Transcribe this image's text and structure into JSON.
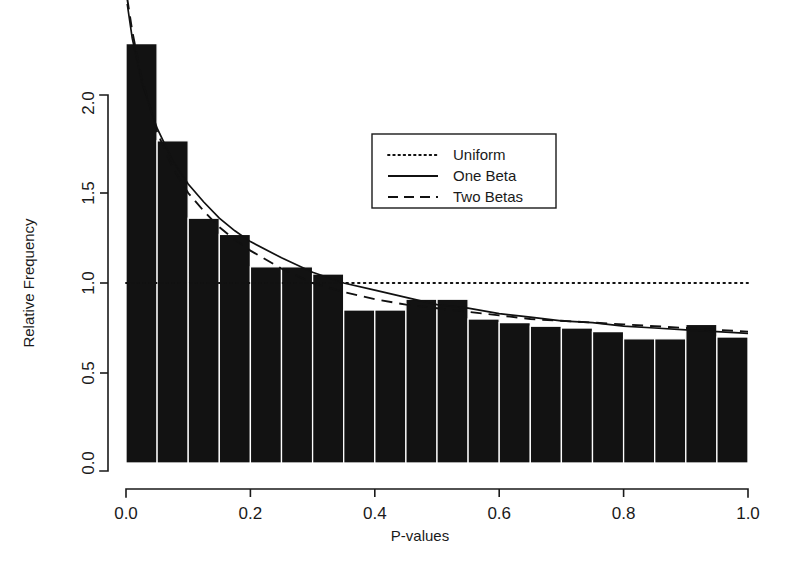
{
  "chart_data": {
    "type": "bar",
    "title": "",
    "subtitle": "",
    "xlabel": "P-values",
    "ylabel": "Relative Frequency",
    "xlim": [
      0.0,
      1.0
    ],
    "ylim": [
      0.0,
      2.4
    ],
    "grid": false,
    "legend_position": "upper-center-right",
    "bin_width": 0.05,
    "bin_edges": [
      0.0,
      0.05,
      0.1,
      0.15,
      0.2,
      0.25,
      0.3,
      0.35,
      0.4,
      0.45,
      0.5,
      0.55,
      0.6,
      0.65,
      0.7,
      0.75,
      0.8,
      0.85,
      0.9,
      0.95,
      1.0
    ],
    "categories": [
      "0.00-0.05",
      "0.05-0.10",
      "0.10-0.15",
      "0.15-0.20",
      "0.20-0.25",
      "0.25-0.30",
      "0.30-0.35",
      "0.35-0.40",
      "0.40-0.45",
      "0.45-0.50",
      "0.50-0.55",
      "0.55-0.60",
      "0.60-0.65",
      "0.65-0.70",
      "0.70-0.75",
      "0.75-0.80",
      "0.80-0.85",
      "0.85-0.90",
      "0.90-0.95",
      "0.95-1.00"
    ],
    "values": [
      2.33,
      1.79,
      1.36,
      1.27,
      1.09,
      1.09,
      1.05,
      0.85,
      0.85,
      0.91,
      0.91,
      0.8,
      0.78,
      0.76,
      0.75,
      0.73,
      0.69,
      0.69,
      0.77,
      0.7
    ],
    "xticks": [
      0.0,
      0.2,
      0.4,
      0.6,
      0.8,
      1.0
    ],
    "xticklabels": [
      "0.0",
      "0.2",
      "0.4",
      "0.6",
      "0.8",
      "1.0"
    ],
    "yticks": [
      0.0,
      0.5,
      1.0,
      1.5,
      2.0
    ],
    "yticklabels": [
      "0.0",
      "0.5",
      "1.0",
      "1.5",
      "2.0"
    ],
    "series": [
      {
        "name": "Uniform",
        "style": "dotted",
        "x": [
          0.0,
          0.1,
          0.2,
          0.3,
          0.4,
          0.5,
          0.6,
          0.7,
          0.8,
          0.9,
          1.0
        ],
        "values": [
          1.0,
          1.0,
          1.0,
          1.0,
          1.0,
          1.0,
          1.0,
          1.0,
          1.0,
          1.0,
          1.0
        ]
      },
      {
        "name": "One Beta",
        "style": "solid",
        "x": [
          0.002,
          0.01,
          0.025,
          0.05,
          0.075,
          0.1,
          0.125,
          0.15,
          0.175,
          0.2,
          0.25,
          0.3,
          0.35,
          0.4,
          0.45,
          0.5,
          0.55,
          0.6,
          0.65,
          0.7,
          0.75,
          0.8,
          0.85,
          0.9,
          0.95,
          1.0
        ],
        "values": [
          2.55,
          2.36,
          2.12,
          1.86,
          1.68,
          1.55,
          1.45,
          1.36,
          1.29,
          1.23,
          1.14,
          1.06,
          1.0,
          0.96,
          0.92,
          0.88,
          0.86,
          0.83,
          0.81,
          0.79,
          0.78,
          0.76,
          0.75,
          0.74,
          0.73,
          0.72
        ]
      },
      {
        "name": "Two Betas",
        "style": "dashed",
        "x": [
          0.002,
          0.01,
          0.025,
          0.05,
          0.075,
          0.1,
          0.125,
          0.15,
          0.175,
          0.2,
          0.25,
          0.3,
          0.35,
          0.4,
          0.45,
          0.5,
          0.55,
          0.6,
          0.65,
          0.7,
          0.75,
          0.8,
          0.85,
          0.9,
          0.95,
          1.0
        ],
        "values": [
          2.58,
          2.4,
          2.14,
          1.84,
          1.64,
          1.5,
          1.4,
          1.31,
          1.24,
          1.18,
          1.08,
          1.0,
          0.95,
          0.91,
          0.88,
          0.86,
          0.84,
          0.82,
          0.8,
          0.79,
          0.78,
          0.77,
          0.76,
          0.75,
          0.74,
          0.73
        ]
      }
    ],
    "legend": [
      {
        "label": "Uniform",
        "style": "dotted"
      },
      {
        "label": "One Beta",
        "style": "solid"
      },
      {
        "label": "Two Betas",
        "style": "dashed"
      }
    ]
  }
}
